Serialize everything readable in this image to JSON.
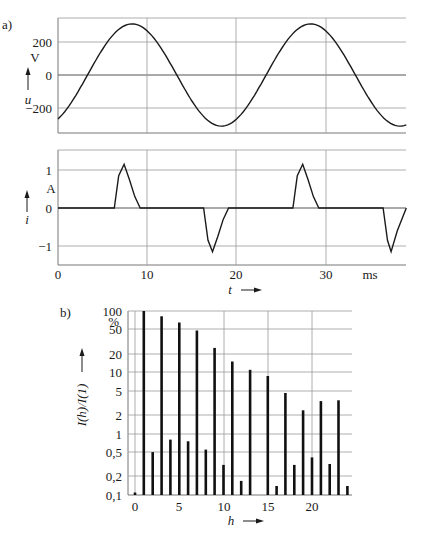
{
  "figure": {
    "panel_a_label": "a)",
    "panel_b_label": "b)"
  },
  "chart_data": [
    {
      "type": "line",
      "panel": "a-top",
      "title": "",
      "xlabel": "t",
      "x_unit": "ms",
      "ylabel": "u",
      "y_unit": "V",
      "xlim": [
        0,
        39
      ],
      "ylim": [
        -330,
        330
      ],
      "x_ticks": [
        "0",
        "10",
        "20",
        "30"
      ],
      "y_ticks": [
        "200",
        "0",
        "-200"
      ],
      "grid": true,
      "series": [
        {
          "name": "u(t)",
          "description": "sinusoidal voltage, amplitude ~310 V, period 20 ms, peaks at t≈8.3 and 28.3 ms",
          "amplitude": 310,
          "period_ms": 20,
          "peak_t_ms": 8.3,
          "x": [
            0,
            2,
            4,
            6,
            8.3,
            10,
            12,
            14,
            16,
            18.3,
            20,
            22,
            24,
            26,
            28.3,
            30,
            32,
            34,
            36,
            38.3,
            39
          ],
          "values": [
            -280,
            -180,
            -40,
            140,
            310,
            275,
            160,
            -10,
            -180,
            -310,
            -275,
            -160,
            10,
            180,
            310,
            275,
            160,
            -10,
            -180,
            -310,
            -305
          ]
        }
      ]
    },
    {
      "type": "line",
      "panel": "a-bottom",
      "xlabel": "t",
      "x_unit": "ms",
      "ylabel": "i",
      "y_unit": "A",
      "xlim": [
        0,
        39
      ],
      "ylim": [
        -1.5,
        1.5
      ],
      "x_ticks": [
        "0",
        "10",
        "20",
        "30"
      ],
      "y_ticks": [
        "1",
        "0",
        "-1"
      ],
      "grid": true,
      "series": [
        {
          "name": "i(t)",
          "description": "rectifier current pulses near voltage peaks",
          "x": [
            0,
            6.3,
            6.8,
            7.4,
            8.0,
            8.6,
            9.2,
            16.3,
            16.8,
            17.3,
            17.9,
            18.5,
            19.1,
            26.3,
            26.8,
            27.4,
            28.0,
            28.6,
            29.2,
            36.4,
            36.9,
            37.3,
            38.0,
            39
          ],
          "values": [
            0,
            0,
            0.85,
            1.15,
            0.75,
            0.3,
            0,
            0,
            -0.85,
            -1.15,
            -0.75,
            -0.3,
            0,
            0,
            0.85,
            1.15,
            0.75,
            0.3,
            0,
            0,
            -0.85,
            -1.15,
            -0.6,
            0
          ]
        }
      ]
    },
    {
      "type": "bar",
      "panel": "b",
      "title": "",
      "xlabel": "h",
      "ylabel": "I(h)/I(1)",
      "y_unit": "%",
      "y_scale": "log",
      "ylim": [
        0.1,
        100
      ],
      "xlim": [
        -0.8,
        24.5
      ],
      "x_ticks": [
        "0",
        "5",
        "10",
        "15",
        "20"
      ],
      "y_ticks": [
        "100",
        "50",
        "20",
        "10",
        "5",
        "2",
        "1",
        "0,5",
        "0,2",
        "0,1"
      ],
      "grid": true,
      "categories": [
        0,
        1,
        2,
        3,
        4,
        5,
        6,
        7,
        8,
        9,
        10,
        11,
        12,
        13,
        14,
        15,
        16,
        17,
        18,
        19,
        20,
        21,
        22,
        23,
        24
      ],
      "values": [
        0.11,
        100,
        0.5,
        82,
        0.8,
        65,
        0.75,
        48,
        0.55,
        25,
        0.31,
        15,
        0.17,
        11,
        0,
        8.7,
        0.14,
        4.6,
        0.31,
        2.4,
        0.41,
        3.4,
        0.32,
        3.5,
        0.14
      ]
    }
  ],
  "labels": {
    "u_axis": {
      "unit": "V",
      "symbol": "u",
      "ticks": [
        "200",
        "0",
        "−200"
      ]
    },
    "i_axis": {
      "unit": "A",
      "symbol": "i",
      "ticks": [
        "1",
        "0",
        "−1"
      ]
    },
    "t_axis": {
      "ticks": [
        "0",
        "10",
        "20",
        "30"
      ],
      "unit": "ms",
      "symbol": "t"
    },
    "h_axis": {
      "ticks": [
        "0",
        "5",
        "10",
        "15",
        "20"
      ],
      "symbol": "h"
    },
    "ratio_axis": {
      "ticks": [
        "100",
        "50",
        "20",
        "10",
        "5",
        "2",
        "1",
        "0,5",
        "0,2",
        "0,1"
      ],
      "unit": "%",
      "symbol": "I(h)/I(1)"
    }
  }
}
